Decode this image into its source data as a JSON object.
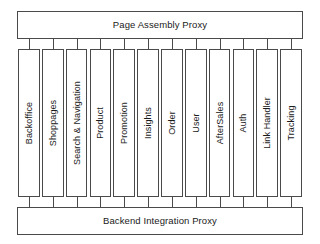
{
  "diagram": {
    "type": "block-architecture-diagram",
    "colors": {
      "stroke": "#4a4a4a",
      "fill": "#ffffff",
      "text": "#1a1a1a"
    },
    "top_proxy": {
      "label": "Page Assembly Proxy"
    },
    "bottom_proxy": {
      "label": "Backend Integration Proxy"
    },
    "columns": [
      {
        "label": "Backoffice"
      },
      {
        "label": "Shoppages"
      },
      {
        "label": "Search & Navigation"
      },
      {
        "label": "Product"
      },
      {
        "label": "Promotion"
      },
      {
        "label": "Insights"
      },
      {
        "label": "Order"
      },
      {
        "label": "User"
      },
      {
        "label": "AfterSales"
      },
      {
        "label": "Auth"
      },
      {
        "label": "Link Handler"
      },
      {
        "label": "Tracking"
      }
    ]
  }
}
